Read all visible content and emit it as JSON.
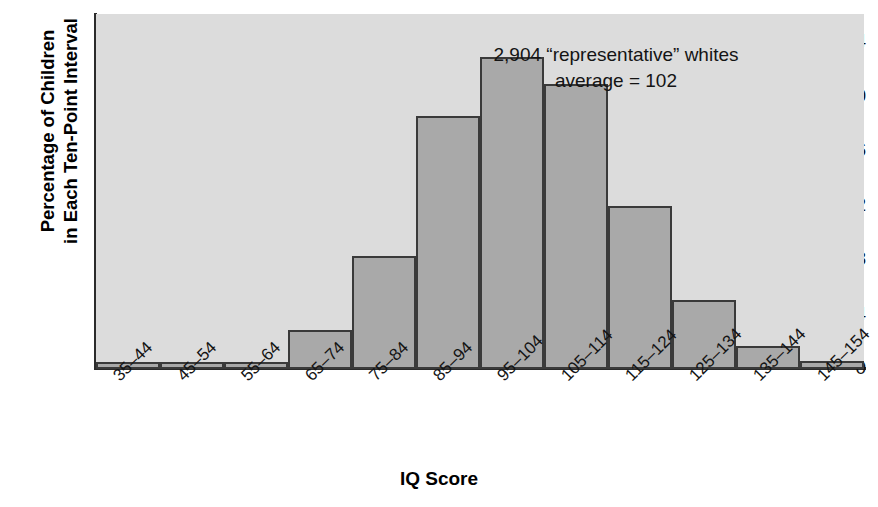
{
  "chart_data": {
    "type": "bar",
    "title": "",
    "subtitle": "",
    "xlabel": "IQ Score",
    "ylabel": "Percentage of Children in Each Ten-Point Interval",
    "ylabel_line1": "Percentage of Children",
    "ylabel_line2": "in Each Ten-Point Interval",
    "categories": [
      "35–44",
      "45–54",
      "55–64",
      "65–74",
      "75–84",
      "85–94",
      "95–104",
      "105–114",
      "115–124",
      "125–134",
      "135–144",
      "145–154"
    ],
    "values": [
      0.5,
      0.5,
      0.5,
      2.9,
      8.3,
      18.6,
      22.9,
      20.9,
      12.0,
      5.1,
      1.7,
      0.6
    ],
    "ylim": [
      0,
      26
    ],
    "yticks": [
      0,
      4,
      8,
      12,
      16,
      20,
      24
    ],
    "ytick_labels": [
      "0",
      "4",
      "8",
      "12",
      "16",
      "20",
      "24"
    ],
    "grid": false,
    "legend": false,
    "legend_position": "none",
    "bar_color": "#a9a9a9",
    "bar_edge_color": "#3a3a3a",
    "plot_background": "#dcdcdc",
    "figure_background": "#ffffff",
    "annotations": [
      "2,904 “representative” whites",
      "average = 102"
    ]
  }
}
